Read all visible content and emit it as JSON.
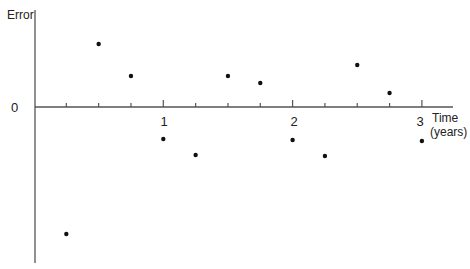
{
  "chart_data": {
    "type": "scatter",
    "title": "",
    "xlabel": "Time (years)",
    "ylabel": "Error",
    "xlim": [
      0,
      3.25
    ],
    "ylim": [
      -150,
      100
    ],
    "y_units": "relative (unscaled axis)",
    "x_ticks_labeled": [
      1,
      2,
      3
    ],
    "x_ticks_minor": [
      0.25,
      0.5,
      0.75,
      1.25,
      1.5,
      1.75,
      2.25,
      2.5,
      2.75
    ],
    "y_ticks_labeled": [
      0
    ],
    "grid": false,
    "legend": null,
    "x": [
      0.25,
      0.5,
      0.75,
      1.0,
      1.25,
      1.5,
      1.75,
      2.0,
      2.25,
      2.5,
      2.75,
      3.0
    ],
    "y": [
      -127,
      63,
      31,
      -32,
      -48,
      31,
      24,
      -33,
      -49,
      42,
      14,
      -34
    ],
    "point_color": "#111111",
    "axis_color": "#555555"
  },
  "labels": {
    "y_axis": "Error",
    "x_axis_line1": "Time",
    "x_axis_line2": "(years)",
    "zero": "0",
    "tick1": "1",
    "tick2": "2",
    "tick3": "3"
  }
}
